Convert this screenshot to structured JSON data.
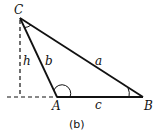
{
  "diagram": {
    "caption": "(b)",
    "vertices": {
      "C": {
        "label": "C"
      },
      "A": {
        "label": "A"
      },
      "B": {
        "label": "B"
      }
    },
    "sides": {
      "a": {
        "label": "a",
        "between": [
          "C",
          "B"
        ]
      },
      "b": {
        "label": "b",
        "between": [
          "C",
          "A"
        ]
      },
      "c": {
        "label": "c",
        "between": [
          "A",
          "B"
        ]
      }
    },
    "height": {
      "label": "h",
      "style": "dashed",
      "from": "C",
      "to": "extended base line"
    },
    "extension": {
      "style": "dashed",
      "description": "base line extended left of A"
    },
    "angle_marks": [
      "C",
      "A",
      "B"
    ],
    "colors": {
      "stroke": "#111111",
      "background": "#ffffff"
    }
  }
}
